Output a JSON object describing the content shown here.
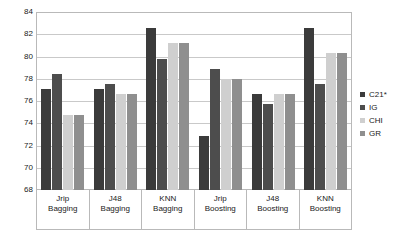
{
  "chart_data": {
    "type": "bar",
    "title": "",
    "xlabel": "",
    "ylabel": "",
    "ylim": [
      68,
      84
    ],
    "yticks": [
      68,
      70,
      72,
      74,
      76,
      78,
      80,
      82,
      84
    ],
    "grid": true,
    "legend_position": "right",
    "categories": [
      "Jrip Bagging",
      "J48 Bagging",
      "KNN Bagging",
      "Jrip Boosting",
      "J48 Boosting",
      "KNN Boosting"
    ],
    "category_lines": [
      [
        "Jrip",
        "Bagging"
      ],
      [
        "J48",
        "Bagging"
      ],
      [
        "KNN",
        "Bagging"
      ],
      [
        "Jrip",
        "Boosting"
      ],
      [
        "J48",
        "Boosting"
      ],
      [
        "KNN",
        "Boosting"
      ]
    ],
    "series": [
      {
        "name": "C21*",
        "color": "#3b3b3b",
        "values": [
          77.1,
          77.1,
          82.6,
          72.9,
          76.6,
          82.6
        ]
      },
      {
        "name": "IG",
        "color": "#4d4d4d",
        "values": [
          78.4,
          77.5,
          79.8,
          78.9,
          75.7,
          77.5
        ]
      },
      {
        "name": "CHI",
        "color": "#cfcfcf",
        "values": [
          74.7,
          76.6,
          81.2,
          78.0,
          76.6,
          80.3
        ]
      },
      {
        "name": "GR",
        "color": "#8f8f8f",
        "values": [
          74.7,
          76.6,
          81.2,
          78.0,
          76.6,
          80.3
        ]
      }
    ]
  }
}
